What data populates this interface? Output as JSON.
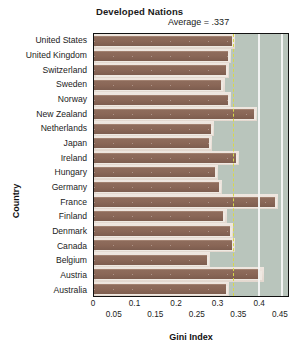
{
  "chart_data": {
    "type": "bar",
    "orientation": "horizontal",
    "title": "Developed Nations",
    "annotation": "Average = .337",
    "average": 0.337,
    "xlabel": "Gini Index",
    "ylabel": "Country",
    "xlim": [
      0,
      0.472
    ],
    "grid": true,
    "gridlines_x": [
      0.4,
      0.455
    ],
    "legend": "none",
    "xticks_upper": [
      "0",
      "0.1",
      "0.2",
      "0.3",
      "0.4"
    ],
    "xticks_upper_values": [
      0,
      0.1,
      0.2,
      0.3,
      0.4
    ],
    "xticks_lower": [
      "0.05",
      "0.15",
      "0.25",
      "0.35",
      "0.45"
    ],
    "xticks_lower_values": [
      0.05,
      0.15,
      0.25,
      0.35,
      0.45
    ],
    "categories": [
      "United States",
      "United Kingdom",
      "Switzerland",
      "Sweden",
      "Norway",
      "New Zealand",
      "Netherlands",
      "Japan",
      "Ireland",
      "Hungary",
      "Germany",
      "France",
      "Finland",
      "Denmark",
      "Canada",
      "Belgium",
      "Austria",
      "Australia"
    ],
    "values": [
      0.335,
      0.325,
      0.32,
      0.31,
      0.325,
      0.39,
      0.285,
      0.28,
      0.345,
      0.295,
      0.305,
      0.44,
      0.315,
      0.33,
      0.335,
      0.275,
      0.405,
      0.32
    ],
    "colors": {
      "bar": "#8a6757",
      "bar_shadow": "#efe9e2",
      "row_band": "#e7ddd4",
      "plot_background": "#b9c5bc",
      "gridline": "#f4f6f4",
      "average_line": "#d8d84a",
      "frame": "#111111",
      "text": "#1a1a1a"
    }
  }
}
